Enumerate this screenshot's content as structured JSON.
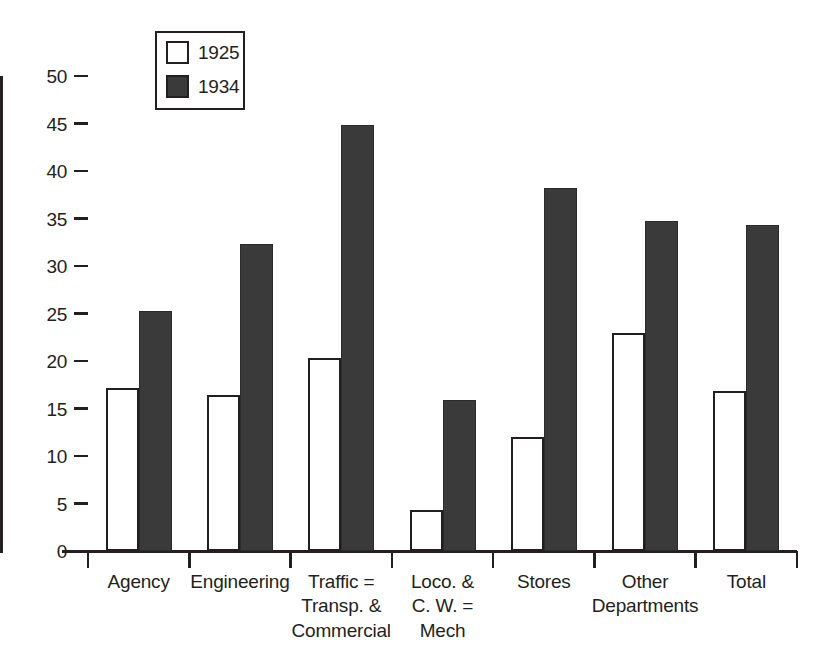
{
  "chart_data": {
    "type": "bar",
    "title": "",
    "subtitle": "",
    "xlabel": "",
    "ylabel": "",
    "ylim": [
      0,
      50
    ],
    "yticks": [
      0,
      5,
      10,
      15,
      20,
      25,
      30,
      35,
      40,
      45,
      50
    ],
    "ytick_labels": [
      "0",
      "5",
      "10",
      "15",
      "20",
      "25",
      "30",
      "35",
      "40",
      "45",
      "50"
    ],
    "grid": false,
    "legend_position": "top-left",
    "categories": [
      "Agency",
      "Engineering",
      "Traffic =\nTransp. &\nCommercial",
      "Loco. &\nC. W. =\nMech",
      "Stores",
      "Other\nDepartments",
      "Total"
    ],
    "series": [
      {
        "name": "1925",
        "color": "#ffffff",
        "edge_color": "#231f20",
        "values": [
          17.2,
          16.4,
          20.3,
          4.3,
          12.0,
          23.0,
          16.8
        ]
      },
      {
        "name": "1934",
        "color": "#3a3a3a",
        "edge_color": "#231f20",
        "values": [
          25.3,
          32.3,
          44.8,
          15.9,
          38.2,
          34.7,
          34.3
        ]
      }
    ]
  },
  "legend": {
    "entries": [
      {
        "label": "1925",
        "swatch": "open-square"
      },
      {
        "label": "1934",
        "swatch": "filled-square"
      }
    ]
  },
  "colors": {
    "fill_dark": "#3a3a3a",
    "fill_light": "#ffffff",
    "ink": "#231f20",
    "background": "#ffffff"
  }
}
